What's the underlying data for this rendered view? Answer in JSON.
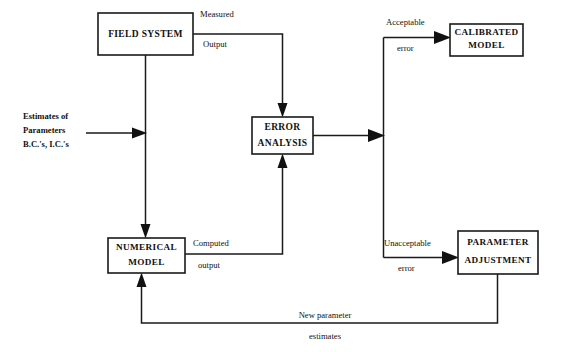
{
  "diagram": {
    "background_color": "#ffffff",
    "line_color": "#1a1a1a",
    "text_color": "#111111",
    "nodes": [
      {
        "id": "field-system",
        "lines": [
          "FIELD SYSTEM"
        ],
        "x": 98,
        "y": 13,
        "w": 95,
        "h": 42
      },
      {
        "id": "error-analysis",
        "lines": [
          "ERROR",
          "ANALYSIS"
        ],
        "x": 252,
        "y": 117,
        "w": 61,
        "h": 37
      },
      {
        "id": "calibrated-model",
        "lines": [
          "CALIBRATED",
          "MODEL"
        ],
        "x": 450,
        "y": 24,
        "w": 73,
        "h": 32
      },
      {
        "id": "numerical-model",
        "lines": [
          "NUMERICAL",
          "MODEL"
        ],
        "x": 108,
        "y": 238,
        "w": 77,
        "h": 35
      },
      {
        "id": "parameter-adjustment",
        "lines": [
          "PARAMETER",
          "ADJUSTMENT"
        ],
        "x": 458,
        "y": 231,
        "w": 80,
        "h": 43
      }
    ],
    "edge_labels": {
      "measured_output_line1": "Measured",
      "measured_output_line2": "Output",
      "computed_output_line1": "Computed",
      "computed_output_line2": "output",
      "acceptable_error_line1": "Acceptable",
      "acceptable_error_line2": "error",
      "unacceptable_error_line1": "Unacceptable",
      "unacceptable_error_line2": "error",
      "new_parameter_line1": "New parameter",
      "new_parameter_line2": "estimates"
    },
    "input_label": {
      "line1": "Estimates of",
      "line2": "Parameters",
      "line3": "B.C.'s, I.C.'s"
    }
  }
}
